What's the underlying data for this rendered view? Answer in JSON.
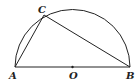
{
  "diagram": {
    "type": "semicircle-inscribed-triangle",
    "points": {
      "A": {
        "label": "A",
        "x": 15,
        "y": 67
      },
      "B": {
        "label": "B",
        "x": 130,
        "y": 67
      },
      "O": {
        "label": "O",
        "x": 72.5,
        "y": 67
      },
      "C": {
        "label": "C",
        "x": 44,
        "y": 15
      }
    },
    "segments": [
      "AB",
      "AC",
      "CB"
    ],
    "arc": "semicircle over diameter AB centered at O",
    "stroke_color": "#222222"
  }
}
